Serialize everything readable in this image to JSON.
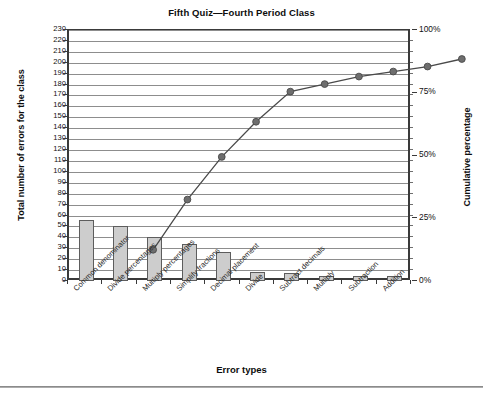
{
  "chart_data": {
    "type": "bar",
    "title": "Fifth Quiz—Fourth Period Class",
    "xlabel": "Error types",
    "ylabel": "Total number of errors for the class",
    "y2label": "Cumulative percentage",
    "categories": [
      "Common denominator",
      "Divide percentages",
      "Multiply percentages",
      "Simplify fractions",
      "Decimal placement",
      "Divide",
      "Subtract decimals",
      "Multiply",
      "Subtraction",
      "Addition"
    ],
    "values": [
      56,
      50,
      40,
      34,
      27,
      8,
      7,
      5,
      5,
      5
    ],
    "cumulative_values": [
      56,
      102,
      140,
      172,
      200,
      208,
      213,
      219,
      223,
      230
    ],
    "cumulative_percentages": [
      24,
      44,
      61,
      75,
      87,
      90,
      93,
      95,
      97,
      100
    ],
    "ylim": [
      0,
      230
    ],
    "ytick_labels": [
      "0",
      "10",
      "20",
      "30",
      "40",
      "50",
      "60",
      "70",
      "80",
      "90",
      "100",
      "110",
      "120",
      "130",
      "140",
      "150",
      "160",
      "170",
      "180",
      "190",
      "200",
      "210",
      "220",
      "230"
    ],
    "y2lim": [
      0,
      100
    ],
    "y2tick_labels": [
      "0%",
      "25%",
      "50%",
      "75%",
      "100%"
    ],
    "grid": true,
    "legend": "none",
    "series": [
      {
        "name": "Total number of errors for the class",
        "type": "bar",
        "values": [
          56,
          50,
          40,
          34,
          27,
          8,
          7,
          5,
          5,
          5
        ]
      },
      {
        "name": "Cumulative percentage",
        "type": "line",
        "values": [
          24,
          44,
          61,
          75,
          87,
          90,
          93,
          95,
          97,
          100
        ]
      }
    ],
    "colors": {
      "bar_fill": "#cdcdcd",
      "bar_border": "#5d5d5d",
      "line": "#4a4a4a",
      "marker": "#6e6e6e",
      "axis": "#3a3a3a",
      "grid": "#8d8d8d",
      "text": "#111111"
    }
  }
}
